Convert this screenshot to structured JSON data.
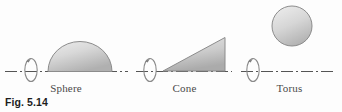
{
  "figure": {
    "caption": "Fig. 5.14",
    "background_color": "#fdfdfd",
    "line_color": "#555555",
    "shape_stroke": "#8c8c8c",
    "shape_fill_light": "#e9e9e9",
    "shape_fill_dark": "#b4b4b4",
    "label_color": "#4a4a4a"
  },
  "panels": [
    {
      "id": "sphere",
      "label": "Sphere",
      "shape_type": "semicircle",
      "description": "half disk rotated about horizontal axis generates a sphere",
      "axis_style": "dash-dot",
      "rotation_arrow": true
    },
    {
      "id": "cone",
      "label": "Cone",
      "shape_type": "right-triangle",
      "description": "right triangle rotated about horizontal axis generates a cone",
      "axis_style": "dash-dot",
      "rotation_arrow": true
    },
    {
      "id": "torus",
      "label": "Torus",
      "shape_type": "circle",
      "description": "circle offset from horizontal axis generates a torus",
      "axis_style": "dash-dot",
      "rotation_arrow": true
    }
  ]
}
